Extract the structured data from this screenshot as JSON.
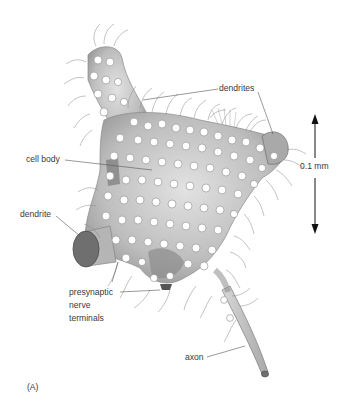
{
  "figure": {
    "panel_label": "(A)",
    "labels": {
      "dendrites": "dendrites",
      "cell_body": "cell body",
      "dendrite": "dendrite",
      "presynaptic": [
        "presynaptic",
        "nerve",
        "terminals"
      ],
      "axon": "axon",
      "scale_bar": "0.1 mm"
    },
    "colors": {
      "background": "#ffffff",
      "cell_fill": "#c9c9c9",
      "cell_shadow": "#6f6f6f",
      "bouton_fill": "#ffffff",
      "outline": "#8a8a8a",
      "text": "#3a3a3a",
      "leader": "#555555",
      "arrow": "#111111"
    }
  }
}
